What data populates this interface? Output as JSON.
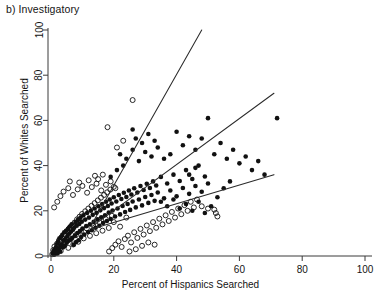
{
  "figure": {
    "panel_label": "b) Investigatory",
    "xlabel": "Percent of Hispanics Searched",
    "ylabel": "Percent of Whites Searched"
  },
  "chart_data": {
    "type": "scatter",
    "title": "b) Investigatory",
    "xlabel": "Percent of Hispanics Searched",
    "ylabel": "Percent of Whites Searched",
    "xlim": [
      0,
      100
    ],
    "ylim": [
      0,
      100
    ],
    "xticks": [
      0,
      20,
      40,
      60,
      80,
      100
    ],
    "yticks": [
      0,
      20,
      40,
      60,
      80,
      100
    ],
    "xtick_labels": [
      "0",
      "20",
      "40",
      "60",
      "80",
      "100"
    ],
    "ytick_labels": [
      "0",
      "20",
      "40",
      "60",
      "80",
      "100"
    ],
    "grid": false,
    "legend": "none",
    "series": [
      {
        "name": "filled-circles",
        "marker": "filled circle",
        "color": "#111111",
        "points": [
          [
            0.5,
            1.0
          ],
          [
            0.8,
            2.2
          ],
          [
            1.0,
            0.6
          ],
          [
            1.2,
            3.0
          ],
          [
            1.4,
            1.5
          ],
          [
            1.6,
            4.0
          ],
          [
            1.8,
            2.4
          ],
          [
            2.0,
            5.5
          ],
          [
            2.1,
            1.1
          ],
          [
            2.3,
            6.5
          ],
          [
            2.5,
            3.3
          ],
          [
            2.7,
            7.8
          ],
          [
            2.9,
            2.0
          ],
          [
            3.0,
            4.6
          ],
          [
            3.2,
            8.5
          ],
          [
            3.4,
            5.2
          ],
          [
            3.6,
            9.4
          ],
          [
            3.8,
            3.8
          ],
          [
            4.0,
            6.9
          ],
          [
            4.2,
            10.5
          ],
          [
            4.4,
            4.4
          ],
          [
            4.6,
            7.6
          ],
          [
            4.8,
            11.2
          ],
          [
            5.0,
            5.9
          ],
          [
            5.2,
            8.8
          ],
          [
            5.4,
            12.0
          ],
          [
            5.6,
            6.7
          ],
          [
            5.8,
            9.9
          ],
          [
            6.0,
            13.0
          ],
          [
            6.2,
            7.3
          ],
          [
            6.4,
            10.8
          ],
          [
            6.6,
            14.0
          ],
          [
            6.8,
            8.1
          ],
          [
            7.0,
            11.6
          ],
          [
            7.2,
            5.0
          ],
          [
            7.4,
            12.5
          ],
          [
            7.6,
            9.0
          ],
          [
            7.8,
            15.0
          ],
          [
            8.0,
            6.2
          ],
          [
            8.2,
            13.4
          ],
          [
            8.4,
            10.2
          ],
          [
            8.6,
            16.0
          ],
          [
            8.8,
            7.0
          ],
          [
            9.0,
            14.2
          ],
          [
            9.2,
            11.0
          ],
          [
            9.4,
            17.0
          ],
          [
            9.6,
            8.4
          ],
          [
            9.8,
            15.2
          ],
          [
            10.0,
            12.1
          ],
          [
            10.3,
            18.0
          ],
          [
            10.6,
            9.5
          ],
          [
            10.9,
            16.1
          ],
          [
            11.2,
            13.2
          ],
          [
            11.5,
            19.0
          ],
          [
            11.8,
            10.6
          ],
          [
            12.1,
            17.0
          ],
          [
            12.4,
            14.0
          ],
          [
            12.7,
            20.0
          ],
          [
            13.0,
            11.4
          ],
          [
            13.3,
            18.2
          ],
          [
            13.6,
            15.1
          ],
          [
            13.9,
            21.0
          ],
          [
            14.2,
            12.5
          ],
          [
            14.5,
            19.1
          ],
          [
            14.8,
            16.2
          ],
          [
            15.1,
            22.0
          ],
          [
            15.4,
            13.4
          ],
          [
            15.7,
            20.2
          ],
          [
            16.0,
            17.1
          ],
          [
            16.3,
            23.0
          ],
          [
            16.6,
            14.6
          ],
          [
            16.9,
            21.2
          ],
          [
            17.2,
            18.0
          ],
          [
            17.5,
            24.0
          ],
          [
            17.8,
            15.5
          ],
          [
            18.1,
            22.1
          ],
          [
            18.4,
            19.2
          ],
          [
            18.7,
            25.0
          ],
          [
            19.0,
            16.4
          ],
          [
            19.3,
            23.2
          ],
          [
            19.6,
            20.1
          ],
          [
            20.0,
            26.0
          ],
          [
            20.4,
            17.5
          ],
          [
            20.8,
            24.1
          ],
          [
            21.2,
            21.0
          ],
          [
            21.6,
            27.0
          ],
          [
            22.0,
            18.4
          ],
          [
            22.4,
            25.2
          ],
          [
            22.8,
            22.1
          ],
          [
            23.2,
            28.0
          ],
          [
            23.6,
            19.5
          ],
          [
            24.0,
            26.1
          ],
          [
            24.4,
            23.0
          ],
          [
            24.8,
            29.0
          ],
          [
            25.2,
            20.4
          ],
          [
            25.6,
            27.2
          ],
          [
            26.0,
            24.1
          ],
          [
            26.5,
            30.0
          ],
          [
            27.0,
            21.5
          ],
          [
            27.5,
            28.1
          ],
          [
            28.0,
            25.0
          ],
          [
            28.5,
            31.0
          ],
          [
            29.0,
            22.4
          ],
          [
            29.5,
            29.2
          ],
          [
            30.0,
            26.1
          ],
          [
            30.5,
            32.0
          ],
          [
            31.0,
            23.5
          ],
          [
            31.5,
            30.1
          ],
          [
            32.0,
            27.0
          ],
          [
            32.5,
            33.0
          ],
          [
            33.0,
            24.4
          ],
          [
            33.5,
            31.2
          ],
          [
            34.0,
            28.1
          ],
          [
            35.0,
            35.0
          ],
          [
            36.0,
            25.5
          ],
          [
            37.0,
            32.1
          ],
          [
            38.0,
            29.0
          ],
          [
            39.0,
            36.0
          ],
          [
            40.0,
            26.4
          ],
          [
            41.0,
            33.2
          ],
          [
            42.0,
            30.1
          ],
          [
            43.0,
            38.0
          ],
          [
            44.0,
            27.5
          ],
          [
            45.0,
            34.1
          ],
          [
            46.0,
            31.0
          ],
          [
            47.0,
            40.0
          ],
          [
            48.0,
            28.4
          ],
          [
            49.0,
            35.2
          ],
          [
            50.0,
            32.1
          ],
          [
            22.0,
            45.0
          ],
          [
            24.0,
            43.0
          ],
          [
            26.0,
            47.0
          ],
          [
            28.0,
            42.0
          ],
          [
            30.0,
            46.0
          ],
          [
            32.0,
            44.0
          ],
          [
            34.0,
            48.0
          ],
          [
            36.0,
            43.0
          ],
          [
            38.0,
            45.0
          ],
          [
            27.0,
            52.0
          ],
          [
            29.0,
            50.0
          ],
          [
            31.0,
            54.0
          ],
          [
            33.0,
            51.0
          ],
          [
            40.0,
            55.0
          ],
          [
            42.0,
            49.0
          ],
          [
            44.0,
            53.0
          ],
          [
            46.0,
            47.0
          ],
          [
            48.0,
            52.0
          ],
          [
            50.0,
            61.0
          ],
          [
            52.0,
            45.0
          ],
          [
            54.0,
            50.0
          ],
          [
            56.0,
            43.0
          ],
          [
            58.0,
            47.0
          ],
          [
            60.0,
            41.0
          ],
          [
            62.0,
            44.0
          ],
          [
            64.0,
            38.0
          ],
          [
            66.0,
            42.0
          ],
          [
            68.0,
            36.0
          ],
          [
            72.0,
            61.0
          ],
          [
            35.0,
            24.0
          ],
          [
            37.0,
            22.0
          ],
          [
            39.0,
            25.0
          ],
          [
            41.0,
            21.0
          ],
          [
            43.0,
            23.0
          ],
          [
            45.0,
            20.0
          ],
          [
            47.0,
            24.0
          ],
          [
            49.0,
            19.0
          ],
          [
            51.0,
            22.0
          ],
          [
            53.0,
            26.0
          ],
          [
            55.0,
            30.0
          ],
          [
            57.0,
            33.0
          ],
          [
            44.0,
            36.0
          ],
          [
            46.0,
            39.0
          ],
          [
            26.0,
            56.0
          ],
          [
            23.0,
            40.0
          ],
          [
            21.0,
            38.0
          ],
          [
            19.0,
            35.0
          ]
        ]
      },
      {
        "name": "open-circles",
        "marker": "open circle",
        "color": "#111111",
        "points": [
          [
            0.4,
            0.8
          ],
          [
            0.7,
            2.6
          ],
          [
            1.1,
            4.2
          ],
          [
            1.5,
            1.3
          ],
          [
            1.9,
            5.4
          ],
          [
            2.2,
            3.1
          ],
          [
            2.6,
            7.0
          ],
          [
            3.1,
            2.2
          ],
          [
            3.5,
            8.2
          ],
          [
            3.9,
            4.9
          ],
          [
            4.3,
            9.6
          ],
          [
            4.7,
            6.1
          ],
          [
            5.1,
            11.0
          ],
          [
            5.5,
            3.6
          ],
          [
            5.9,
            12.4
          ],
          [
            6.3,
            7.5
          ],
          [
            6.7,
            13.6
          ],
          [
            7.1,
            5.1
          ],
          [
            7.5,
            14.8
          ],
          [
            7.9,
            9.2
          ],
          [
            8.3,
            16.2
          ],
          [
            8.7,
            6.3
          ],
          [
            9.1,
            17.4
          ],
          [
            9.5,
            10.8
          ],
          [
            9.9,
            18.6
          ],
          [
            10.4,
            7.8
          ],
          [
            10.9,
            19.8
          ],
          [
            11.4,
            12.2
          ],
          [
            11.9,
            21.0
          ],
          [
            12.4,
            8.9
          ],
          [
            12.9,
            22.2
          ],
          [
            13.4,
            13.6
          ],
          [
            13.9,
            23.4
          ],
          [
            14.4,
            10.1
          ],
          [
            14.9,
            24.6
          ],
          [
            15.4,
            15.0
          ],
          [
            15.9,
            25.8
          ],
          [
            16.4,
            11.2
          ],
          [
            16.9,
            27.0
          ],
          [
            17.4,
            16.4
          ],
          [
            17.9,
            28.2
          ],
          [
            18.4,
            12.4
          ],
          [
            18.9,
            29.4
          ],
          [
            19.4,
            17.8
          ],
          [
            20.0,
            30.6
          ],
          [
            1.0,
            21.5
          ],
          [
            2.0,
            24.0
          ],
          [
            3.0,
            26.5
          ],
          [
            4.0,
            28.5
          ],
          [
            5.5,
            30.0
          ],
          [
            7.0,
            27.0
          ],
          [
            8.5,
            29.5
          ],
          [
            10.0,
            31.0
          ],
          [
            11.5,
            28.0
          ],
          [
            13.0,
            30.5
          ],
          [
            14.5,
            32.0
          ],
          [
            16.0,
            29.0
          ],
          [
            17.5,
            31.5
          ],
          [
            19.0,
            33.0
          ],
          [
            20.5,
            30.0
          ],
          [
            15.0,
            34.0
          ],
          [
            12.0,
            33.5
          ],
          [
            9.0,
            32.5
          ],
          [
            6.0,
            33.0
          ],
          [
            18.0,
            57.0
          ],
          [
            26.0,
            69.0
          ],
          [
            21.0,
            48.0
          ],
          [
            23.0,
            51.0
          ],
          [
            18.5,
            2.0
          ],
          [
            19.5,
            3.5
          ],
          [
            20.5,
            5.0
          ],
          [
            21.5,
            6.5
          ],
          [
            22.5,
            4.0
          ],
          [
            23.5,
            7.5
          ],
          [
            24.5,
            9.0
          ],
          [
            25.5,
            6.0
          ],
          [
            26.5,
            10.5
          ],
          [
            27.5,
            8.0
          ],
          [
            28.5,
            12.0
          ],
          [
            29.5,
            9.5
          ],
          [
            30.5,
            13.5
          ],
          [
            31.5,
            11.0
          ],
          [
            32.5,
            15.0
          ],
          [
            33.5,
            12.5
          ],
          [
            34.5,
            16.5
          ],
          [
            35.5,
            14.0
          ],
          [
            36.5,
            18.0
          ],
          [
            37.5,
            15.5
          ],
          [
            38.5,
            19.5
          ],
          [
            39.5,
            17.0
          ],
          [
            40.5,
            21.0
          ],
          [
            41.5,
            18.5
          ],
          [
            42.5,
            22.5
          ],
          [
            43.5,
            20.0
          ],
          [
            44.5,
            24.0
          ],
          [
            45.5,
            21.5
          ],
          [
            46.5,
            25.0
          ],
          [
            48.0,
            22.0
          ],
          [
            50.0,
            21.0
          ],
          [
            52.0,
            20.5
          ],
          [
            20.0,
            15.0
          ],
          [
            22.0,
            13.0
          ],
          [
            24.0,
            17.0
          ],
          [
            25.0,
            2.0
          ],
          [
            27.0,
            3.0
          ],
          [
            29.0,
            4.5
          ],
          [
            31.0,
            6.0
          ],
          [
            33.0,
            5.0
          ],
          [
            16.5,
            36.0
          ],
          [
            14.0,
            35.5
          ],
          [
            52.5,
            19.0
          ],
          [
            53.0,
            17.5
          ]
        ]
      }
    ],
    "reference_lines": [
      {
        "name": "upper-line",
        "x": [
          13.0,
          48.0
        ],
        "y": [
          14.0,
          100.0
        ]
      },
      {
        "name": "middle-line",
        "x": [
          13.0,
          71.0
        ],
        "y": [
          13.0,
          72.0
        ]
      },
      {
        "name": "lower-line",
        "x": [
          13.0,
          71.0
        ],
        "y": [
          12.0,
          36.0
        ]
      }
    ]
  }
}
